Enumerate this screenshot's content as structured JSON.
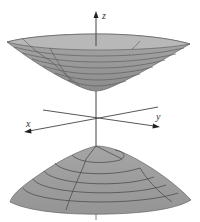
{
  "figure": {
    "type": "hyperboloid-of-two-sheets",
    "axes": {
      "x_label": "x",
      "y_label": "y",
      "z_label": "z"
    },
    "colors": {
      "surface": "#9a9a9a",
      "surface_dark": "#8a8a8a",
      "rim": "#b5b5b5",
      "grid_line": "#505050",
      "axis": "#444444",
      "background": "#ffffff"
    },
    "upper_sheet": {
      "level_curves": 7,
      "meridians": 4
    },
    "lower_sheet": {
      "level_curves": 6,
      "meridians": 4
    }
  }
}
